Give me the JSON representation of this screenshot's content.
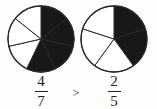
{
  "figure": {
    "type": "fraction-comparison-diagram",
    "background_color": "#fdfdfc",
    "line_color": "#2b2728",
    "shaded_color": "#1a1718",
    "unshaded_color": "#ffffff"
  },
  "comparison": {
    "operator": ">",
    "operator_name": "greater-than"
  },
  "fractions": {
    "left": {
      "numerator": "4",
      "denominator": "7",
      "label": "4/7"
    },
    "right": {
      "numerator": "2",
      "denominator": "5",
      "label": "2/5"
    }
  },
  "chart_data": {
    "type": "pie",
    "title": "",
    "charts": [
      {
        "name": "left-pie",
        "center_x": 41,
        "center_y": 39,
        "radius": 33,
        "total_sectors": 7,
        "shaded_sectors": 4,
        "start_angle_deg": 0,
        "sector_angle_deg": 51.4286,
        "categories": [
          "s1",
          "s2",
          "s3",
          "s4",
          "s5",
          "s6",
          "s7"
        ],
        "values": [
          1,
          1,
          1,
          1,
          1,
          1,
          1
        ],
        "shaded_flags": [
          1,
          1,
          1,
          1,
          0,
          0,
          0
        ],
        "fraction_value": 0.5714
      },
      {
        "name": "right-pie",
        "center_x": 114,
        "center_y": 39,
        "radius": 33,
        "total_sectors": 5,
        "shaded_sectors": 2,
        "start_angle_deg": 0,
        "sector_angle_deg": 72,
        "categories": [
          "s1",
          "s2",
          "s3",
          "s4",
          "s5"
        ],
        "values": [
          1,
          1,
          1,
          1,
          1
        ],
        "shaded_flags": [
          1,
          1,
          0,
          0,
          0
        ],
        "fraction_value": 0.4
      }
    ],
    "xlabel": "",
    "ylabel": "",
    "legend": []
  }
}
